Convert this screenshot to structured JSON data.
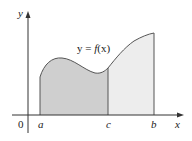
{
  "diagram": {
    "type": "area-under-curve",
    "curve_label": "y = f(x)",
    "curve_label_parts": {
      "lhs": "y = ",
      "fn": "f",
      "arg": "(x)"
    },
    "axes": {
      "x_label": "x",
      "y_label": "y",
      "origin_label": "0"
    },
    "ticks": [
      {
        "label": "a",
        "px": 40
      },
      {
        "label": "c",
        "px": 108
      },
      {
        "label": "b",
        "px": 154
      }
    ],
    "regions": [
      {
        "name": "a-to-c",
        "from": "a",
        "to": "c",
        "color": "#cfcfcf"
      },
      {
        "name": "c-to-b",
        "from": "c",
        "to": "b",
        "color": "#ededed"
      }
    ],
    "colors": {
      "axis": "#333333",
      "curve": "#555555",
      "dark_region": "#cfcfcf",
      "light_region": "#ededed"
    }
  }
}
